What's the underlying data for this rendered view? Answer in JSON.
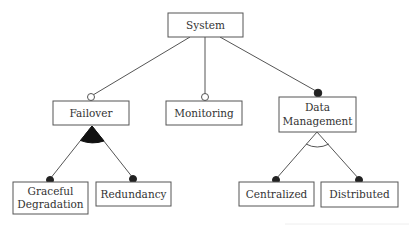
{
  "diagram": {
    "type": "feature-model",
    "nodes": {
      "system": {
        "label": "System"
      },
      "failover": {
        "label": "Failover"
      },
      "monitoring": {
        "label": "Monitoring"
      },
      "data_management": {
        "label_line1": "Data",
        "label_line2": "Management"
      },
      "graceful_degradation": {
        "label_line1": "Graceful",
        "label_line2": "Degradation"
      },
      "redundancy": {
        "label": "Redundancy"
      },
      "centralized": {
        "label": "Centralized"
      },
      "distributed": {
        "label": "Distributed"
      }
    },
    "edges": [
      {
        "from": "System",
        "to": "Failover",
        "kind": "optional"
      },
      {
        "from": "System",
        "to": "Monitoring",
        "kind": "optional"
      },
      {
        "from": "System",
        "to": "Data Management",
        "kind": "mandatory"
      },
      {
        "from": "Failover",
        "to": "Graceful Degradation",
        "kind": "mandatory",
        "group": "or"
      },
      {
        "from": "Failover",
        "to": "Redundancy",
        "kind": "mandatory",
        "group": "or"
      },
      {
        "from": "Data Management",
        "to": "Centralized",
        "kind": "mandatory",
        "group": "alternative"
      },
      {
        "from": "Data Management",
        "to": "Distributed",
        "kind": "mandatory",
        "group": "alternative"
      }
    ],
    "colors": {
      "stroke": "#555555",
      "text": "#333333",
      "filled_marker": "#222222",
      "background": "#ffffff"
    }
  }
}
